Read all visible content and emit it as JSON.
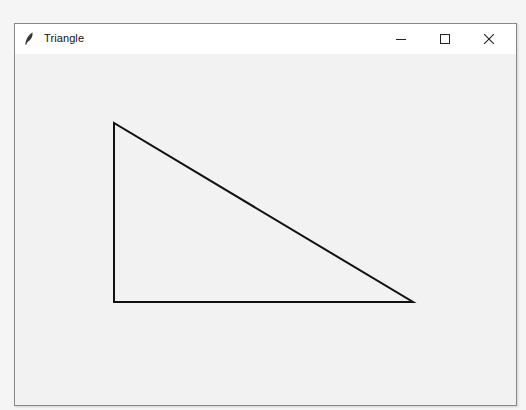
{
  "window": {
    "title": "Triangle",
    "icon": "feather-icon",
    "controls": {
      "minimize": "minimize-icon",
      "maximize": "maximize-icon",
      "close": "close-icon"
    }
  },
  "canvas": {
    "background": "#f2f2f2",
    "shape": {
      "type": "triangle",
      "stroke": "#111111",
      "stroke_width": 2,
      "fill": "none",
      "vertices": [
        {
          "x": 114,
          "y": 123
        },
        {
          "x": 114,
          "y": 302
        },
        {
          "x": 413,
          "y": 302
        }
      ]
    }
  }
}
